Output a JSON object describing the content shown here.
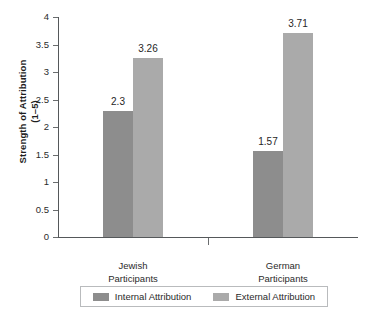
{
  "chart_data": {
    "type": "bar",
    "title": "",
    "xlabel": "",
    "ylabel": "Strength of Attribution\n(1–5)",
    "ylim": [
      0,
      4
    ],
    "ytick_labels": [
      "0",
      "0.5",
      "1",
      "1.5",
      "2",
      "2.5",
      "3",
      "3.5",
      "4"
    ],
    "ytick_values": [
      0,
      0.5,
      1,
      1.5,
      2,
      2.5,
      3,
      3.5,
      4
    ],
    "grid": false,
    "legend_position": "bottom",
    "categories": [
      "Jewish\nParticipants",
      "German\nParticipants"
    ],
    "series": [
      {
        "name": "Internal Attribution",
        "color": "#8d8d8d",
        "values": [
          2.3,
          1.57
        ],
        "value_labels": [
          "2.3",
          "1.57"
        ]
      },
      {
        "name": "External Attribution",
        "color": "#aaaaaa",
        "values": [
          3.26,
          3.71
        ],
        "value_labels": [
          "3.26",
          "3.71"
        ]
      }
    ]
  },
  "colors": {
    "internal": "#8d8d8d",
    "external": "#aaaaaa",
    "axis": "#55585a",
    "text": "#2b2b2b",
    "legend_border": "#b9bbbd",
    "background": "#ffffff"
  }
}
